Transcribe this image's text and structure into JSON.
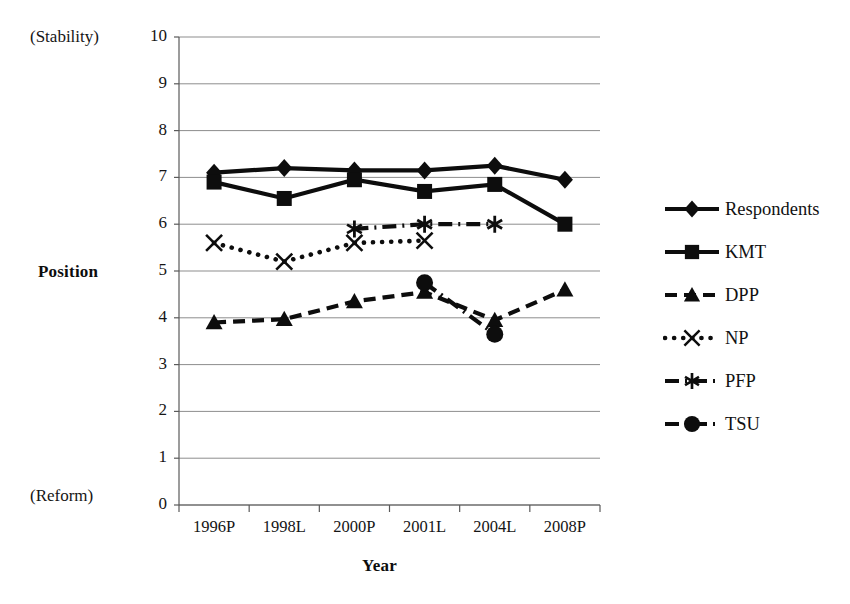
{
  "chart_data": {
    "type": "line",
    "title": "",
    "xlabel": "Year",
    "ylabel": "Position",
    "axis_end_labels": {
      "top": "(Stability)",
      "bottom": "(Reform)"
    },
    "categories": [
      "1996P",
      "1998L",
      "2000P",
      "2001L",
      "2004L",
      "2008P"
    ],
    "ylim": [
      0,
      10
    ],
    "yticks": [
      "10",
      "9",
      "8",
      "7",
      "6",
      "5",
      "4",
      "3",
      "2",
      "1",
      "0"
    ],
    "grid": true,
    "legend_position": "right",
    "series": [
      {
        "name": "Respondents",
        "marker": "diamond",
        "line": "solid",
        "values": [
          7.1,
          7.2,
          7.15,
          7.15,
          7.25,
          6.95
        ]
      },
      {
        "name": "KMT",
        "marker": "square",
        "line": "solid",
        "values": [
          6.9,
          6.55,
          6.95,
          6.7,
          6.85,
          6.0
        ]
      },
      {
        "name": "DPP",
        "marker": "triangle",
        "line": "dashed",
        "values": [
          3.9,
          3.97,
          4.35,
          4.55,
          3.95,
          4.6
        ]
      },
      {
        "name": "NP",
        "marker": "cross",
        "line": "dotted",
        "values": [
          5.6,
          5.2,
          5.6,
          5.65,
          null,
          null
        ]
      },
      {
        "name": "PFP",
        "marker": "star",
        "line": "dash-dot",
        "values": [
          null,
          null,
          5.9,
          6.0,
          6.0,
          null
        ]
      },
      {
        "name": "TSU",
        "marker": "circle",
        "line": "dash-dot",
        "values": [
          null,
          null,
          null,
          4.75,
          3.65,
          null
        ]
      }
    ]
  },
  "colors": {
    "ink": "#111111",
    "grid": "#8d8d8d",
    "axis": "#5a5a5a",
    "background": "#ffffff"
  }
}
